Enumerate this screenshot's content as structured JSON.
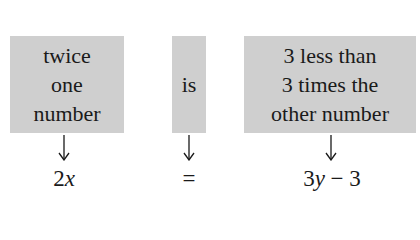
{
  "phrases": [
    {
      "lines": [
        "twice",
        "one",
        "number"
      ]
    },
    {
      "lines": [
        "is"
      ]
    },
    {
      "lines": [
        "3 less than",
        "3 times the",
        "other number"
      ]
    }
  ],
  "equation": {
    "left": {
      "coef": "2",
      "var": "x"
    },
    "middle": "=",
    "right": {
      "coef": "3",
      "var": "y",
      "rest": " − 3"
    }
  },
  "colors": {
    "box_fill": "#cfcfcf",
    "text": "#1a1a1a"
  }
}
